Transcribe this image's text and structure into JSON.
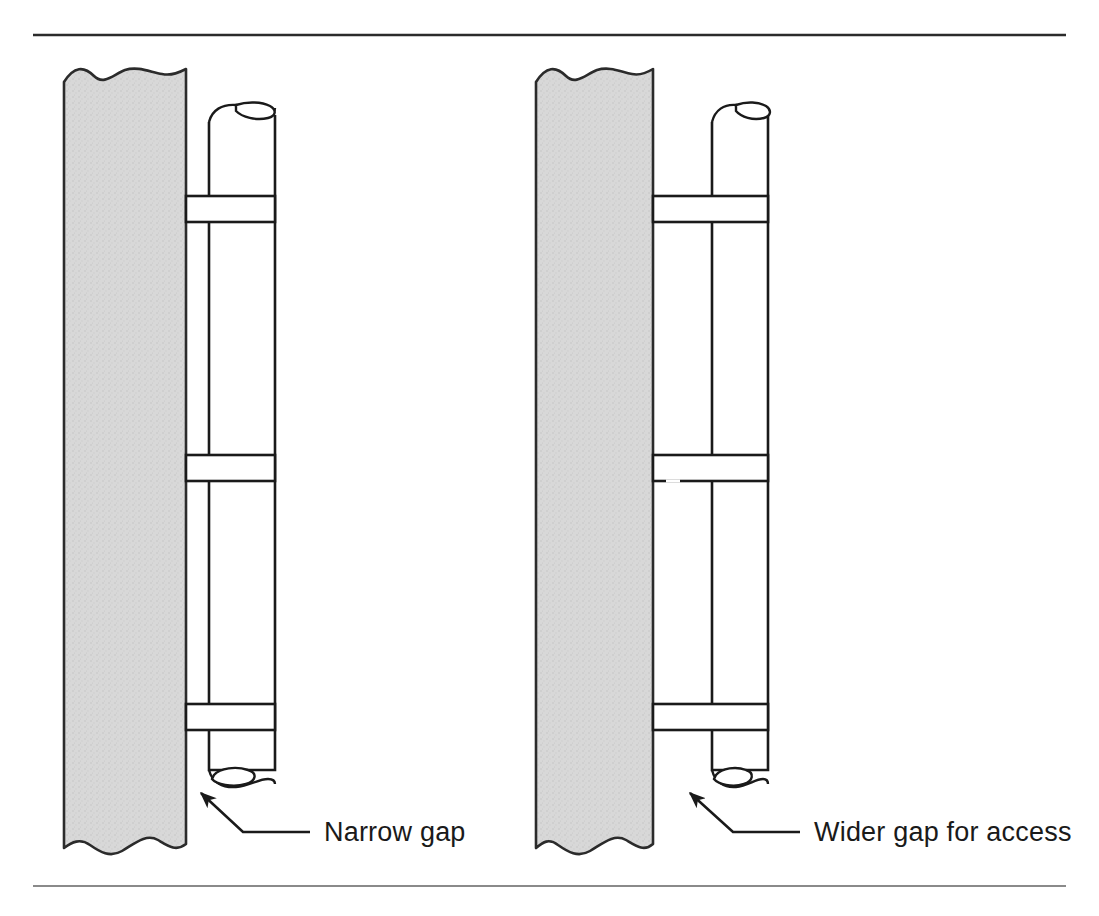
{
  "figure": {
    "background_color": "#ffffff",
    "rules": {
      "top_rule_color": "#2b2b2b",
      "bottom_rule_color": "#8a8a8a"
    },
    "colors": {
      "wall_fill": "#d6d6d6",
      "wall_stroke": "#2b2b2b",
      "pipe_fill": "#ffffff",
      "pipe_stroke": "#1a1a1a",
      "bracket_fill": "#ffffff",
      "bracket_stroke": "#1a1a1a",
      "leader_stroke": "#1a1a1a",
      "label_text": "#1a1a1a"
    },
    "panels": [
      {
        "id": "narrow",
        "name": "narrow-gap-panel",
        "label": "Narrow gap",
        "gap_description": "narrow",
        "wall": {
          "x": 64,
          "y": 68,
          "width": 122,
          "height": 790
        },
        "pipe": {
          "left": 209,
          "right": 275,
          "top": 100,
          "bottom": 790
        },
        "brackets": [
          {
            "name": "upper-bracket",
            "top": 196,
            "bottom": 222
          },
          {
            "name": "middle-bracket",
            "top": 455,
            "bottom": 481
          },
          {
            "name": "lower-bracket",
            "top": 704,
            "bottom": 730
          }
        ],
        "leader": {
          "arrow_tip_x": 201,
          "arrow_tip_y": 793,
          "elbow_x": 243,
          "elbow_y": 832,
          "end_x": 310,
          "end_y": 832
        },
        "label_position": {
          "x": 324,
          "y": 832
        }
      },
      {
        "id": "wider",
        "name": "wider-gap-panel",
        "label": "Wider gap for access",
        "gap_description": "wider",
        "wall": {
          "x": 536,
          "y": 68,
          "width": 117,
          "height": 790
        },
        "pipe": {
          "left": 712,
          "right": 768,
          "top": 100,
          "bottom": 790
        },
        "brackets": [
          {
            "name": "upper-bracket",
            "top": 196,
            "bottom": 222
          },
          {
            "name": "middle-bracket",
            "top": 455,
            "bottom": 481
          },
          {
            "name": "lower-bracket",
            "top": 704,
            "bottom": 730
          }
        ],
        "leader": {
          "arrow_tip_x": 690,
          "arrow_tip_y": 793,
          "elbow_x": 733,
          "elbow_y": 832,
          "end_x": 800,
          "end_y": 832
        },
        "label_position": {
          "x": 814,
          "y": 832
        }
      }
    ]
  }
}
